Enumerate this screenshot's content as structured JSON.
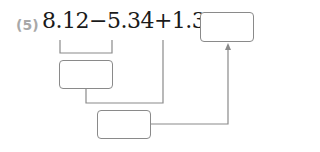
{
  "problem": {
    "number_label": "(5)",
    "expression": "8.12−5.34+1.37=",
    "answer_box": "",
    "intermediate_box_1": "",
    "intermediate_box_2": ""
  },
  "colors": {
    "label": "#a8a8a8",
    "text": "#1a1a1a",
    "lines": "#8a8a8a"
  }
}
